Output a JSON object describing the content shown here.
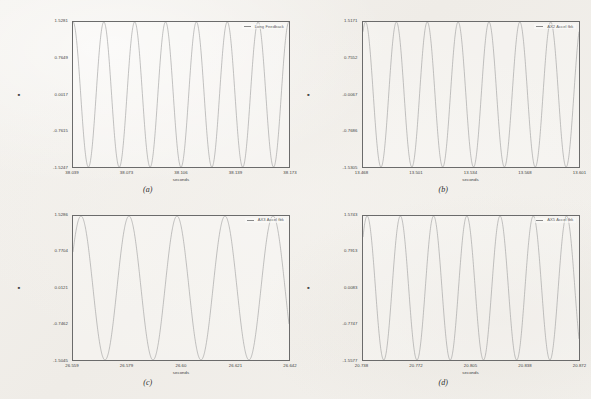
{
  "figure": {
    "background_color": "#f2f0ec",
    "trace_color": "#9a9a9a",
    "frame_color": "#6b6b6b",
    "x_axis_unit": "seconds",
    "y_axis_marker": "■"
  },
  "panels": [
    {
      "caption": "(a)",
      "legend": "Long Feedback",
      "x_ticks": [
        "38.039",
        "38.073",
        "38.106",
        "38.139",
        "38.173"
      ],
      "y_ticks": [
        "1.5281",
        "0.7649",
        "0.0017",
        "-0.7615",
        "-1.5247"
      ],
      "xlabel": "seconds"
    },
    {
      "caption": "(b)",
      "legend": "AX2 Accel fbk",
      "x_ticks": [
        "13.468",
        "13.501",
        "13.534",
        "13.568",
        "13.601"
      ],
      "y_ticks": [
        "1.5171",
        "0.7552",
        "-0.0067",
        "-0.7686",
        "-1.5305"
      ],
      "xlabel": "seconds"
    },
    {
      "caption": "(c)",
      "legend": "AX3 Accel fbk",
      "x_ticks": [
        "26.559",
        "26.579",
        "26.60",
        "26.621",
        "26.642"
      ],
      "y_ticks": [
        "1.5286",
        "0.7704",
        "0.0121",
        "-0.7462",
        "-1.5045"
      ],
      "xlabel": "seconds"
    },
    {
      "caption": "(d)",
      "legend": "AX5 Accel fbk",
      "x_ticks": [
        "20.738",
        "20.772",
        "20.805",
        "20.838",
        "20.872"
      ],
      "y_ticks": [
        "1.5743",
        "0.7913",
        "0.0083",
        "-0.7747",
        "-1.5577"
      ],
      "xlabel": "seconds"
    }
  ],
  "chart_data": [
    {
      "type": "line",
      "title": "",
      "panel": "(a)",
      "series": [
        {
          "name": "Long Feedback",
          "waveform": "sine",
          "amplitude": 1.5281,
          "offset": 0.0017,
          "cycles": 7.0,
          "phase_deg": 90
        }
      ],
      "xlabel": "seconds",
      "ylabel": "",
      "xlim": [
        38.039,
        38.173
      ],
      "ylim": [
        -1.5247,
        1.5281
      ],
      "xticks": [
        38.039,
        38.073,
        38.106,
        38.139,
        38.173
      ],
      "yticks": [
        1.5281,
        0.7649,
        0.0017,
        -0.7615,
        -1.5247
      ],
      "grid": false,
      "legend_position": "top-right"
    },
    {
      "type": "line",
      "title": "",
      "panel": "(b)",
      "series": [
        {
          "name": "AX2 Accel fbk",
          "waveform": "sine",
          "amplitude": 1.5238,
          "offset": -0.0067,
          "cycles": 7.0,
          "phase_deg": 60
        }
      ],
      "xlabel": "seconds",
      "ylabel": "",
      "xlim": [
        13.468,
        13.601
      ],
      "ylim": [
        -1.5305,
        1.5171
      ],
      "xticks": [
        13.468,
        13.501,
        13.534,
        13.568,
        13.601
      ],
      "yticks": [
        1.5171,
        0.7552,
        -0.0067,
        -0.7686,
        -1.5305
      ],
      "grid": false,
      "legend_position": "top-right"
    },
    {
      "type": "line",
      "title": "",
      "panel": "(c)",
      "series": [
        {
          "name": "AX3 Accel fbk",
          "waveform": "sine",
          "amplitude": 1.5165,
          "offset": 0.0121,
          "cycles": 4.5,
          "phase_deg": 30
        }
      ],
      "xlabel": "seconds",
      "ylabel": "",
      "xlim": [
        26.559,
        26.642
      ],
      "ylim": [
        -1.5045,
        1.5286
      ],
      "xticks": [
        26.559,
        26.579,
        26.6,
        26.621,
        26.642
      ],
      "yticks": [
        1.5286,
        0.7704,
        0.0121,
        -0.7462,
        -1.5045
      ],
      "grid": false,
      "legend_position": "top-right"
    },
    {
      "type": "line",
      "title": "",
      "panel": "(d)",
      "series": [
        {
          "name": "AX5 Accel fbk",
          "waveform": "sine",
          "amplitude": 1.566,
          "offset": 0.0083,
          "cycles": 6.5,
          "phase_deg": 45
        }
      ],
      "xlabel": "seconds",
      "ylabel": "",
      "xlim": [
        20.738,
        20.872
      ],
      "ylim": [
        -1.5577,
        1.5743
      ],
      "xticks": [
        20.738,
        20.772,
        20.805,
        20.838,
        20.872
      ],
      "yticks": [
        1.5743,
        0.7913,
        0.0083,
        -0.7747,
        -1.5577
      ],
      "grid": false,
      "legend_position": "top-right"
    }
  ]
}
